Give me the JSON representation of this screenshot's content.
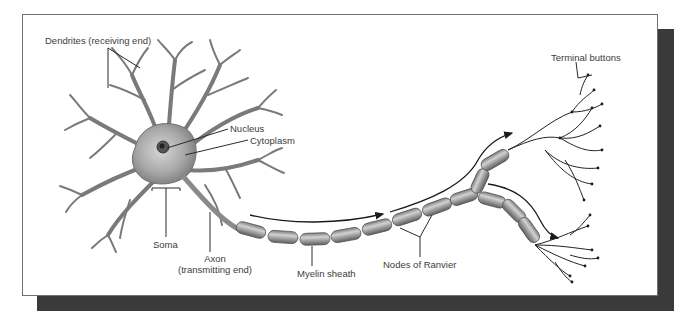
{
  "figure": {
    "colors": {
      "panel_border": "#6e6e6e",
      "shadow": "#3a3a3a",
      "cell_fill": "#a8a8a8",
      "cell_dark": "#6f6f6f",
      "myelin": "#9a9a9a",
      "label_text": "#3c3c3c",
      "lines": "#2a2a2a"
    }
  },
  "labels": {
    "dendrites": "Dendrites (receiving end)",
    "nucleus": "Nucleus",
    "cytoplasm": "Cytoplasm",
    "soma": "Soma",
    "axon": "Axon",
    "axon_sub": "(transmitting end)",
    "myelin": "Myelin sheath",
    "nodes": "Nodes of Ranvier",
    "terminal": "Terminal buttons"
  },
  "arrows": [
    {
      "name": "signal-direction-main",
      "direction": "toward axon terminals"
    },
    {
      "name": "signal-direction-upper-branch",
      "direction": "up-right"
    },
    {
      "name": "signal-direction-lower-branch",
      "direction": "down-right"
    }
  ]
}
